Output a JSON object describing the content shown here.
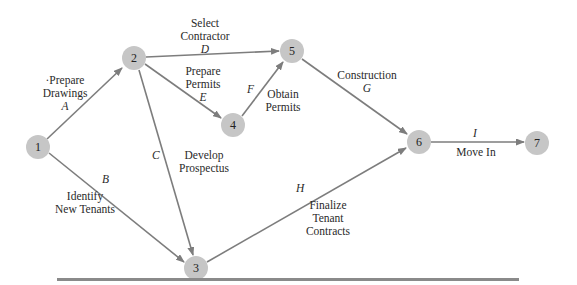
{
  "diagram": {
    "type": "activity-on-arrow network",
    "nodes": [
      {
        "id": "1",
        "x": 38,
        "y": 147
      },
      {
        "id": "2",
        "x": 134,
        "y": 58
      },
      {
        "id": "3",
        "x": 196,
        "y": 268
      },
      {
        "id": "4",
        "x": 233,
        "y": 125
      },
      {
        "id": "5",
        "x": 292,
        "y": 51
      },
      {
        "id": "6",
        "x": 419,
        "y": 142
      },
      {
        "id": "7",
        "x": 537,
        "y": 143
      }
    ],
    "activities": [
      {
        "letter": "A",
        "from": "1",
        "to": "2",
        "line1": "·Prepare",
        "line2": "Drawings"
      },
      {
        "letter": "B",
        "from": "1",
        "to": "3",
        "line1": "Identify",
        "line2": "New Tenants"
      },
      {
        "letter": "C",
        "from": "2",
        "to": "3",
        "line1": "Develop",
        "line2": "Prospectus"
      },
      {
        "letter": "D",
        "from": "2",
        "to": "5",
        "line1": "Select",
        "line2": "Contractor"
      },
      {
        "letter": "E",
        "from": "2",
        "to": "4",
        "line1": "Prepare",
        "line2": "Permits"
      },
      {
        "letter": "F",
        "from": "4",
        "to": "5",
        "line1": "Obtain",
        "line2": "Permits"
      },
      {
        "letter": "G",
        "from": "5",
        "to": "6",
        "line1": "Construction"
      },
      {
        "letter": "H",
        "from": "3",
        "to": "6",
        "line1": "Finalize",
        "line2": "Tenant",
        "line3": "Contracts"
      },
      {
        "letter": "I",
        "from": "6",
        "to": "7",
        "line1": "Move In"
      }
    ],
    "colors": {
      "node": "#c6c6c6",
      "edge": "#7d7d7d",
      "divider": "#8a8a8a"
    }
  }
}
